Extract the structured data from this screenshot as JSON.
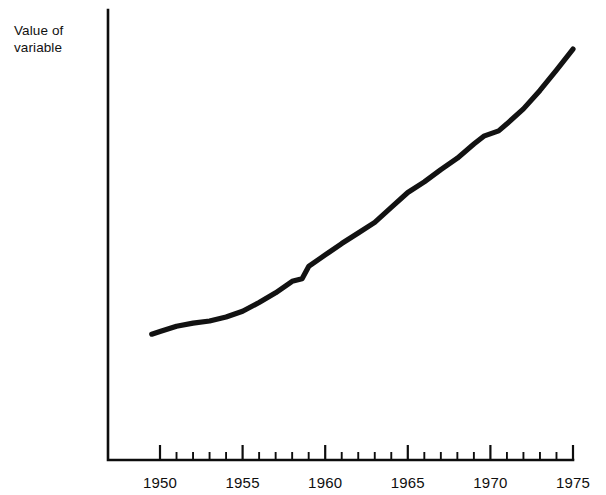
{
  "figure": {
    "axis_label_y": "Value of\nvariable",
    "ink_color": "#121212",
    "background_color": "#ffffff"
  },
  "chart_data": {
    "type": "line",
    "title": "",
    "xlabel": "",
    "ylabel": "Value of variable",
    "grid": false,
    "legend": null,
    "xlim": [
      1948.5,
      1975.6
    ],
    "ylim": [
      0,
      100
    ],
    "x_tick_labels": [
      "1950",
      "1955",
      "1960",
      "1965",
      "1970",
      "1975"
    ],
    "x_major_ticks": [
      1950,
      1955,
      1960,
      1965,
      1970,
      1975
    ],
    "x_minor_ticks": [
      1951,
      1952,
      1953,
      1954,
      1956,
      1957,
      1958,
      1959,
      1961,
      1962,
      1963,
      1964,
      1966,
      1967,
      1968,
      1969,
      1971,
      1972,
      1973,
      1974
    ],
    "y_axis_ticks": [],
    "series": [
      {
        "name": "Value of variable",
        "x": [
          1949.5,
          1950,
          1951,
          1952,
          1953,
          1954,
          1955,
          1956,
          1957,
          1958,
          1958.6,
          1959,
          1960,
          1961,
          1962,
          1963,
          1964,
          1965,
          1966,
          1967,
          1968,
          1969,
          1969.6,
          1970.5,
          1971,
          1972,
          1973,
          1974,
          1975
        ],
        "values": [
          28.6,
          29.2,
          30.4,
          31.1,
          31.6,
          32.5,
          33.8,
          35.8,
          38.0,
          40.6,
          41.2,
          44.0,
          46.6,
          49.2,
          51.6,
          54.0,
          57.4,
          60.8,
          63.2,
          66.0,
          68.6,
          71.8,
          73.6,
          74.8,
          76.4,
          79.8,
          84.0,
          88.6,
          93.4
        ]
      }
    ],
    "annotations": []
  },
  "geometry": {
    "x_axis_y": 460,
    "y_axis_x": 108,
    "y_axis_top": 10,
    "x_axis_right": 573,
    "px_per_year": 16.52,
    "year_origin_x": 160,
    "y_value_top_px": 20,
    "y_value_bottom_px": 460
  }
}
